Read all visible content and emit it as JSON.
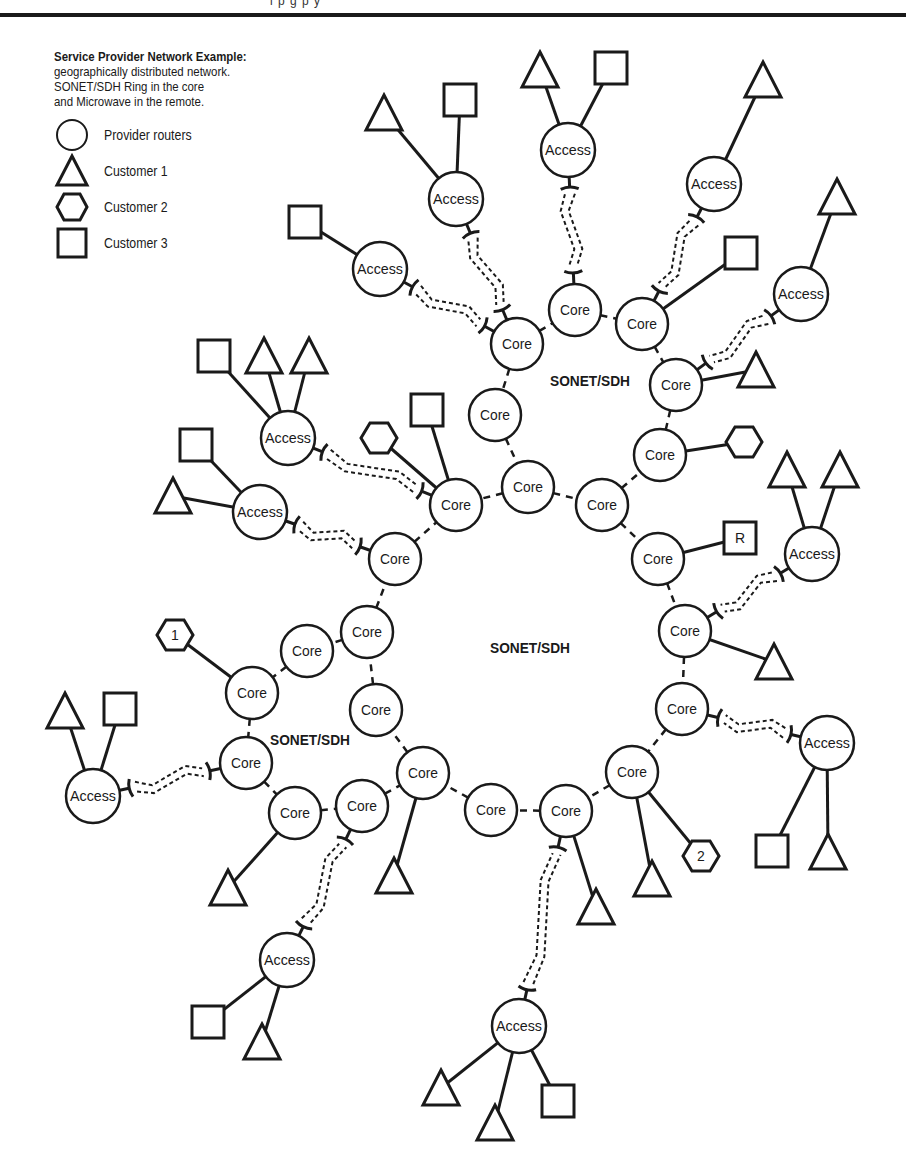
{
  "header": {
    "sliver_text": "i  p   g  p   y"
  },
  "legend": {
    "title": "Service Provider Network Example:",
    "description": [
      "geographically distributed network.",
      "SONET/SDH Ring in the core",
      "and Microwave in the remote."
    ],
    "items": [
      {
        "shape": "circle",
        "label": "Provider routers"
      },
      {
        "shape": "triangle",
        "label": "Customer 1"
      },
      {
        "shape": "hexagon",
        "label": "Customer 2"
      },
      {
        "shape": "square",
        "label": "Customer 3"
      }
    ]
  },
  "colors": {
    "stroke": "#1a1a1a",
    "fill": "#ffffff"
  },
  "ring_labels": [
    {
      "text": "SONET/SDH",
      "x": 550,
      "y": 386
    },
    {
      "text": "SONET/SDH",
      "x": 490,
      "y": 653
    },
    {
      "text": "SONET/SDH",
      "x": 270,
      "y": 745
    }
  ],
  "nodes": [
    {
      "id": "c1",
      "type": "router",
      "label": "Core",
      "x": 517,
      "y": 344
    },
    {
      "id": "c2",
      "type": "router",
      "label": "Core",
      "x": 575,
      "y": 310
    },
    {
      "id": "c3",
      "type": "router",
      "label": "Core",
      "x": 642,
      "y": 324
    },
    {
      "id": "c4",
      "type": "router",
      "label": "Core",
      "x": 676,
      "y": 385
    },
    {
      "id": "c5",
      "type": "router",
      "label": "Core",
      "x": 660,
      "y": 455
    },
    {
      "id": "c6",
      "type": "router",
      "label": "Core",
      "x": 495,
      "y": 415
    },
    {
      "id": "c7",
      "type": "router",
      "label": "Core",
      "x": 528,
      "y": 487
    },
    {
      "id": "c8",
      "type": "router",
      "label": "Core",
      "x": 602,
      "y": 505
    },
    {
      "id": "c9",
      "type": "router",
      "label": "Core",
      "x": 456,
      "y": 505
    },
    {
      "id": "c10",
      "type": "router",
      "label": "Core",
      "x": 658,
      "y": 559
    },
    {
      "id": "c11",
      "type": "router",
      "label": "Core",
      "x": 685,
      "y": 631
    },
    {
      "id": "c12",
      "type": "router",
      "label": "Core",
      "x": 682,
      "y": 709
    },
    {
      "id": "c13",
      "type": "router",
      "label": "Core",
      "x": 632,
      "y": 772
    },
    {
      "id": "c14",
      "type": "router",
      "label": "Core",
      "x": 566,
      "y": 811
    },
    {
      "id": "c15",
      "type": "router",
      "label": "Core",
      "x": 491,
      "y": 810
    },
    {
      "id": "c16",
      "type": "router",
      "label": "Core",
      "x": 423,
      "y": 773
    },
    {
      "id": "c17",
      "type": "router",
      "label": "Core",
      "x": 376,
      "y": 710
    },
    {
      "id": "c18",
      "type": "router",
      "label": "Core",
      "x": 367,
      "y": 632
    },
    {
      "id": "c19",
      "type": "router",
      "label": "Core",
      "x": 395,
      "y": 559
    },
    {
      "id": "c20",
      "type": "router",
      "label": "Core",
      "x": 307,
      "y": 651
    },
    {
      "id": "c21",
      "type": "router",
      "label": "Core",
      "x": 252,
      "y": 693
    },
    {
      "id": "c22",
      "type": "router",
      "label": "Core",
      "x": 246,
      "y": 763
    },
    {
      "id": "c23",
      "type": "router",
      "label": "Core",
      "x": 295,
      "y": 813
    },
    {
      "id": "c24",
      "type": "router",
      "label": "Core",
      "x": 362,
      "y": 806
    },
    {
      "id": "a1",
      "type": "router",
      "label": "Access",
      "x": 568,
      "y": 150
    },
    {
      "id": "a2",
      "type": "router",
      "label": "Access",
      "x": 456,
      "y": 199
    },
    {
      "id": "a3",
      "type": "router",
      "label": "Access",
      "x": 380,
      "y": 269
    },
    {
      "id": "a4",
      "type": "router",
      "label": "Access",
      "x": 714,
      "y": 184
    },
    {
      "id": "a5",
      "type": "router",
      "label": "Access",
      "x": 801,
      "y": 294
    },
    {
      "id": "a6",
      "type": "router",
      "label": "Access",
      "x": 288,
      "y": 438
    },
    {
      "id": "a7",
      "type": "router",
      "label": "Access",
      "x": 260,
      "y": 512
    },
    {
      "id": "a8",
      "type": "router",
      "label": "Access",
      "x": 812,
      "y": 554
    },
    {
      "id": "a9",
      "type": "router",
      "label": "Access",
      "x": 827,
      "y": 743
    },
    {
      "id": "a10",
      "type": "router",
      "label": "Access",
      "x": 93,
      "y": 796
    },
    {
      "id": "a11",
      "type": "router",
      "label": "Access",
      "x": 287,
      "y": 960
    },
    {
      "id": "a12",
      "type": "router",
      "label": "Access",
      "x": 519,
      "y": 1026
    },
    {
      "id": "t1",
      "type": "triangle",
      "x": 540,
      "y": 70
    },
    {
      "id": "s1",
      "type": "square",
      "x": 611,
      "y": 68
    },
    {
      "id": "t2",
      "type": "triangle",
      "x": 384,
      "y": 113
    },
    {
      "id": "s2",
      "type": "square",
      "x": 460,
      "y": 100
    },
    {
      "id": "s3",
      "type": "square",
      "x": 305,
      "y": 222
    },
    {
      "id": "t3",
      "type": "triangle",
      "x": 763,
      "y": 80
    },
    {
      "id": "t4",
      "type": "triangle",
      "x": 837,
      "y": 197
    },
    {
      "id": "s4",
      "type": "square",
      "x": 741,
      "y": 253
    },
    {
      "id": "t5",
      "type": "triangle",
      "x": 756,
      "y": 370
    },
    {
      "id": "h1",
      "type": "hexagon",
      "x": 744,
      "y": 442,
      "label": ""
    },
    {
      "id": "s5",
      "type": "square",
      "x": 214,
      "y": 356
    },
    {
      "id": "t6",
      "type": "triangle",
      "x": 264,
      "y": 356
    },
    {
      "id": "t7",
      "type": "triangle",
      "x": 309,
      "y": 356
    },
    {
      "id": "s6",
      "type": "square",
      "x": 196,
      "y": 445
    },
    {
      "id": "t8",
      "type": "triangle",
      "x": 173,
      "y": 496
    },
    {
      "id": "h2",
      "type": "hexagon",
      "x": 379,
      "y": 438,
      "label": ""
    },
    {
      "id": "s7",
      "type": "square",
      "x": 427,
      "y": 410
    },
    {
      "id": "s8",
      "type": "square",
      "label": "R",
      "x": 740,
      "y": 538
    },
    {
      "id": "t9",
      "type": "triangle",
      "x": 787,
      "y": 470
    },
    {
      "id": "t10",
      "type": "triangle",
      "x": 840,
      "y": 470
    },
    {
      "id": "t11",
      "type": "triangle",
      "x": 774,
      "y": 662
    },
    {
      "id": "h3",
      "type": "hexagon",
      "x": 175,
      "y": 635,
      "label": "1"
    },
    {
      "id": "t12",
      "type": "triangle",
      "x": 65,
      "y": 711
    },
    {
      "id": "s9",
      "type": "square",
      "x": 120,
      "y": 709
    },
    {
      "id": "s10",
      "type": "square",
      "x": 772,
      "y": 851
    },
    {
      "id": "t13",
      "type": "triangle",
      "x": 828,
      "y": 852
    },
    {
      "id": "h4",
      "type": "hexagon",
      "x": 701,
      "y": 856,
      "label": "2"
    },
    {
      "id": "t14",
      "type": "triangle",
      "x": 652,
      "y": 879
    },
    {
      "id": "t15",
      "type": "triangle",
      "x": 596,
      "y": 907
    },
    {
      "id": "t16",
      "type": "triangle",
      "x": 394,
      "y": 876
    },
    {
      "id": "t17",
      "type": "triangle",
      "x": 228,
      "y": 888
    },
    {
      "id": "s11",
      "type": "square",
      "x": 208,
      "y": 1022
    },
    {
      "id": "t18",
      "type": "triangle",
      "x": 262,
      "y": 1042
    },
    {
      "id": "t19",
      "type": "triangle",
      "x": 441,
      "y": 1088
    },
    {
      "id": "t20",
      "type": "triangle",
      "x": 495,
      "y": 1123
    },
    {
      "id": "s12",
      "type": "square",
      "x": 558,
      "y": 1101
    }
  ],
  "ring_links": [
    [
      "c1",
      "c2"
    ],
    [
      "c2",
      "c3"
    ],
    [
      "c3",
      "c4"
    ],
    [
      "c4",
      "c5"
    ],
    [
      "c1",
      "c6"
    ],
    [
      "c6",
      "c7"
    ],
    [
      "c7",
      "c8"
    ],
    [
      "c7",
      "c9"
    ],
    [
      "c8",
      "c5"
    ],
    [
      "c8",
      "c10"
    ],
    [
      "c10",
      "c11"
    ],
    [
      "c11",
      "c12"
    ],
    [
      "c12",
      "c13"
    ],
    [
      "c13",
      "c14"
    ],
    [
      "c14",
      "c15"
    ],
    [
      "c15",
      "c16"
    ],
    [
      "c16",
      "c17"
    ],
    [
      "c17",
      "c18"
    ],
    [
      "c18",
      "c19"
    ],
    [
      "c19",
      "c9"
    ],
    [
      "c18",
      "c20"
    ],
    [
      "c20",
      "c21"
    ],
    [
      "c21",
      "c22"
    ],
    [
      "c22",
      "c23"
    ],
    [
      "c23",
      "c24"
    ],
    [
      "c24",
      "c16"
    ]
  ],
  "microwave_links": [
    [
      "a1",
      "c2"
    ],
    [
      "a2",
      "c1"
    ],
    [
      "a3",
      "c1"
    ],
    [
      "a4",
      "c3"
    ],
    [
      "a5",
      "c4"
    ],
    [
      "a6",
      "c9"
    ],
    [
      "a7",
      "c19"
    ],
    [
      "a8",
      "c11"
    ],
    [
      "a9",
      "c12"
    ],
    [
      "a10",
      "c22"
    ],
    [
      "a11",
      "c24"
    ],
    [
      "a12",
      "c14"
    ]
  ],
  "access_links": [
    [
      "a1",
      "t1"
    ],
    [
      "a1",
      "s1"
    ],
    [
      "a2",
      "t2"
    ],
    [
      "a2",
      "s2"
    ],
    [
      "a3",
      "s3"
    ],
    [
      "a4",
      "t3"
    ],
    [
      "a5",
      "t4"
    ],
    [
      "c3",
      "s4"
    ],
    [
      "c4",
      "t5"
    ],
    [
      "c5",
      "h1"
    ],
    [
      "a6",
      "s5"
    ],
    [
      "a6",
      "t6"
    ],
    [
      "a6",
      "t7"
    ],
    [
      "a7",
      "s6"
    ],
    [
      "a7",
      "t8"
    ],
    [
      "c9",
      "h2"
    ],
    [
      "c9",
      "s7"
    ],
    [
      "c10",
      "s8"
    ],
    [
      "a8",
      "t9"
    ],
    [
      "a8",
      "t10"
    ],
    [
      "c11",
      "t11"
    ],
    [
      "c21",
      "h3"
    ],
    [
      "a10",
      "t12"
    ],
    [
      "a10",
      "s9"
    ],
    [
      "a9",
      "s10"
    ],
    [
      "a9",
      "t13"
    ],
    [
      "c13",
      "h4"
    ],
    [
      "c13",
      "t14"
    ],
    [
      "c14",
      "t15"
    ],
    [
      "c16",
      "t16"
    ],
    [
      "c23",
      "t17"
    ],
    [
      "a11",
      "s11"
    ],
    [
      "a11",
      "t18"
    ],
    [
      "a12",
      "t19"
    ],
    [
      "a12",
      "t20"
    ],
    [
      "a12",
      "s12"
    ]
  ]
}
